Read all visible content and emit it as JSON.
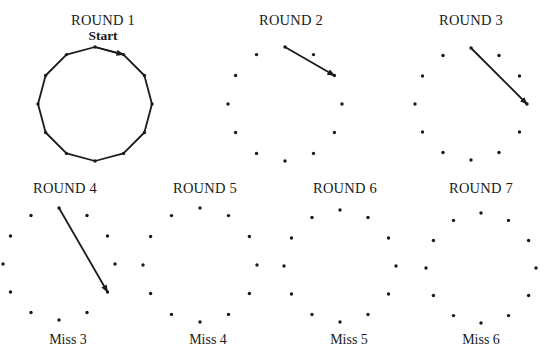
{
  "figure": {
    "point_count": 12,
    "stroke_color": "#1a1a1a",
    "dot_color": "#1a1a1a"
  },
  "rounds": [
    {
      "title": "ROUND 1",
      "subtitle": "Start",
      "caption": "",
      "center": [
        95,
        104
      ],
      "radius": 57,
      "title_pos": [
        103,
        13
      ],
      "subtitle_pos": [
        103,
        29
      ],
      "caption_pos": null,
      "mode": "polygon",
      "arrow": {
        "from": 0,
        "to": 1
      }
    },
    {
      "title": "ROUND 2",
      "subtitle": "",
      "caption": "",
      "center": [
        285,
        104
      ],
      "radius": 57,
      "title_pos": [
        291,
        13
      ],
      "subtitle_pos": null,
      "caption_pos": null,
      "mode": "dots",
      "arrow": {
        "from": 0,
        "to": 2
      }
    },
    {
      "title": "ROUND 3",
      "subtitle": "",
      "caption": "",
      "center": [
        471,
        104
      ],
      "radius": 56,
      "title_pos": [
        471,
        13
      ],
      "subtitle_pos": null,
      "caption_pos": null,
      "mode": "dots",
      "arrow": {
        "from": 0,
        "to": 3
      }
    },
    {
      "title": "ROUND 4",
      "subtitle": "",
      "caption": "Miss 3",
      "center": [
        59,
        264
      ],
      "radius": 56,
      "title_pos": [
        65,
        181
      ],
      "subtitle_pos": null,
      "caption_pos": [
        68,
        333
      ],
      "mode": "dots",
      "arrow": {
        "from": 0,
        "to": 4
      }
    },
    {
      "title": "ROUND 5",
      "subtitle": "",
      "caption": "Miss 4",
      "center": [
        200,
        265
      ],
      "radius": 57,
      "title_pos": [
        205,
        181
      ],
      "subtitle_pos": null,
      "caption_pos": [
        208,
        333
      ],
      "mode": "dots",
      "arrow": null
    },
    {
      "title": "ROUND 6",
      "subtitle": "",
      "caption": "Miss 5",
      "center": [
        340,
        266
      ],
      "radius": 56,
      "title_pos": [
        345,
        181
      ],
      "subtitle_pos": null,
      "caption_pos": [
        349,
        333
      ],
      "mode": "dots",
      "arrow": null
    },
    {
      "title": "ROUND 7",
      "subtitle": "",
      "caption": "Miss 6",
      "center": [
        481,
        268
      ],
      "radius": 55,
      "title_pos": [
        481,
        181
      ],
      "subtitle_pos": null,
      "caption_pos": [
        481,
        333
      ],
      "mode": "dots",
      "arrow": null
    }
  ]
}
